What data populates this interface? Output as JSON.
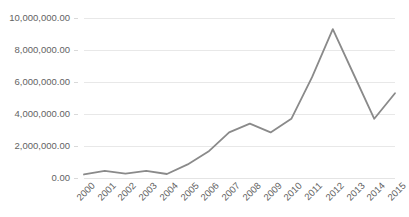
{
  "chart_data": {
    "type": "line",
    "title": "",
    "subtitle": "",
    "xlabel": "",
    "ylabel": "",
    "categories": [
      "2000",
      "2001",
      "2002",
      "2003",
      "2004",
      "2005",
      "2006",
      "2007",
      "2008",
      "2009",
      "2010",
      "2011",
      "2012",
      "2013",
      "2014",
      "2015"
    ],
    "series": [
      {
        "name": "",
        "values": [
          220000,
          450000,
          280000,
          450000,
          250000,
          850000,
          1650000,
          2850000,
          3400000,
          2850000,
          3700000,
          6300000,
          9300000,
          6500000,
          3700000,
          5300000
        ]
      }
    ],
    "ylim": [
      0,
      10000000
    ],
    "ytick_values": [
      0,
      2000000,
      4000000,
      6000000,
      8000000,
      10000000
    ],
    "ytick_labels": [
      "0.00",
      "2,000,000.00",
      "4,000,000.00",
      "6,000,000.00",
      "8,000,000.00",
      "10,000,000.00"
    ],
    "grid": {
      "horizontal": true,
      "vertical": false,
      "color": "#e8e8e8"
    },
    "legend": {
      "visible": false,
      "position": "none",
      "entries": []
    },
    "style": {
      "line_color": "#8a8a8a",
      "line_width": 1.8,
      "markers": false,
      "background": "#ffffff",
      "tick_label_color": "#636363",
      "xtick_rotation_deg": -45
    },
    "annotations": []
  }
}
